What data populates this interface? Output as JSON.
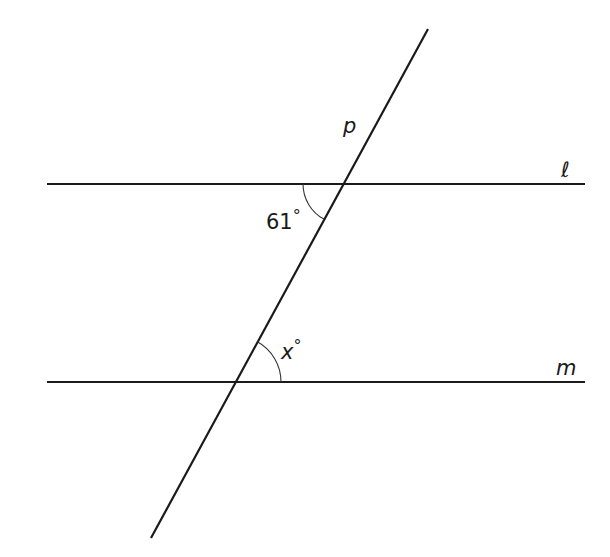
{
  "diagram": {
    "type": "parallel-lines-transversal",
    "lines": {
      "l": {
        "label": "ℓ",
        "x1": 47,
        "y1": 184,
        "x2": 585,
        "y2": 184
      },
      "m": {
        "label": "m",
        "x1": 47,
        "y1": 382,
        "x2": 585,
        "y2": 382
      },
      "p": {
        "label": "p",
        "x1": 428,
        "y1": 29,
        "x2": 151,
        "y2": 538
      }
    },
    "angles": {
      "given": {
        "label": "61°",
        "value": "61",
        "unit": "°"
      },
      "unknown": {
        "label": "x°",
        "var": "x",
        "unit": "°"
      }
    },
    "colors": {
      "stroke": "#1a1a1a",
      "background": "#ffffff"
    }
  }
}
